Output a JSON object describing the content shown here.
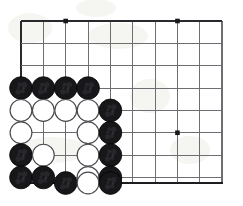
{
  "figure": {
    "background_color": "#ffffff",
    "width": 243,
    "height": 206
  },
  "board": {
    "origin_x": 21,
    "origin_y": 21,
    "spacing": 22.35,
    "columns": 10,
    "rows": 8,
    "bottom_edge_y": 183,
    "right_edge_x": 222,
    "line_color": "#6e6e72",
    "edge_color": "#2a2a2e",
    "star_color": "#19191c",
    "star_points": [
      {
        "name": "star-top-left",
        "col": 3,
        "row": 1
      },
      {
        "name": "star-top-right",
        "col": 8,
        "row": 1
      },
      {
        "name": "star-center-right",
        "col": 8,
        "row": 6
      }
    ]
  },
  "stones": {
    "black_color": "#17171a",
    "white_color": "#ffffff",
    "white_outline_color": "#4a4a4e",
    "radius": 11.4,
    "list": [
      {
        "name": "stone-black-c1-r4",
        "color": "black",
        "col": 1,
        "row": 4
      },
      {
        "name": "stone-black-c2-r4",
        "color": "black",
        "col": 2,
        "row": 4
      },
      {
        "name": "stone-black-c3-r4",
        "color": "black",
        "col": 3,
        "row": 4
      },
      {
        "name": "stone-black-c4-r4",
        "color": "black",
        "col": 4,
        "row": 4
      },
      {
        "name": "stone-white-c1-r5",
        "color": "white",
        "col": 1,
        "row": 5
      },
      {
        "name": "stone-white-c2-r5",
        "color": "white",
        "col": 2,
        "row": 5
      },
      {
        "name": "stone-white-c3-r5",
        "color": "white",
        "col": 3,
        "row": 5
      },
      {
        "name": "stone-white-c4-r5",
        "color": "white",
        "col": 4,
        "row": 5
      },
      {
        "name": "stone-black-c5-r5",
        "color": "black",
        "col": 5,
        "row": 5
      },
      {
        "name": "stone-white-c1-r6",
        "color": "white",
        "col": 1,
        "row": 6
      },
      {
        "name": "stone-white-c4-r6",
        "color": "white",
        "col": 4,
        "row": 6
      },
      {
        "name": "stone-black-c5-r6",
        "color": "black",
        "col": 5,
        "row": 6
      },
      {
        "name": "stone-black-c1-r7",
        "color": "black",
        "col": 1,
        "row": 7
      },
      {
        "name": "stone-white-c2-r7",
        "color": "white",
        "col": 2,
        "row": 7
      },
      {
        "name": "stone-white-c4-r7",
        "color": "white",
        "col": 4,
        "row": 7
      },
      {
        "name": "stone-black-c5-r7",
        "color": "black",
        "col": 5,
        "row": 7
      },
      {
        "name": "stone-black-c1-r8",
        "color": "black",
        "col": 1,
        "row": 8
      },
      {
        "name": "stone-black-c2-r8",
        "color": "black",
        "col": 2,
        "row": 8
      },
      {
        "name": "stone-white-c4-r8",
        "color": "white",
        "col": 4,
        "row": 8
      },
      {
        "name": "stone-black-c5-r8",
        "color": "black",
        "col": 5,
        "row": 8
      },
      {
        "name": "stone-black-c3-r9",
        "color": "black",
        "col": 3,
        "row": 9
      },
      {
        "name": "stone-white-c4-r9",
        "color": "white",
        "col": 4,
        "row": 9
      },
      {
        "name": "stone-black-c5-r9",
        "color": "black",
        "col": 5,
        "row": 9
      }
    ]
  }
}
